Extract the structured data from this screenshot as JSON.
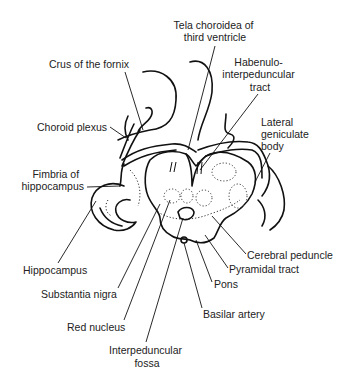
{
  "diagram": {
    "labels": {
      "tela_choroidea": [
        "Tela choroidea of",
        "third ventricle"
      ],
      "crus_fornix": [
        "Crus of the fornix"
      ],
      "habenulo": [
        "Habenulo-",
        "interpeduncular",
        "tract"
      ],
      "lateral_geniculate": [
        "Lateral",
        "geniculate",
        "body"
      ],
      "choroid_plexus": [
        "Choroid plexus"
      ],
      "fimbria": [
        "Fimbria of",
        "hippocampus"
      ],
      "hippocampus": [
        "Hippocampus"
      ],
      "substantia_nigra": [
        "Substantia nigra"
      ],
      "red_nucleus": [
        "Red nucleus"
      ],
      "interpeduncular_fossa": [
        "Interpeduncular",
        "fossa"
      ],
      "cerebral_peduncle": [
        "Cerebral peduncle"
      ],
      "pyramidal_tract": [
        "Pyramidal tract"
      ],
      "pons": [
        "Pons"
      ],
      "basilar_artery": [
        "Basilar artery"
      ]
    }
  }
}
